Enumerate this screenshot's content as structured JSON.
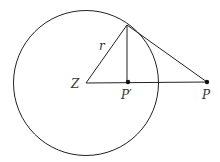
{
  "diagram": {
    "type": "geometry",
    "labels": {
      "center": "Z",
      "radius": "r",
      "foot": "P′",
      "external_point": "P"
    },
    "colors": {
      "stroke": "#222222",
      "background": "#ffffff"
    }
  }
}
